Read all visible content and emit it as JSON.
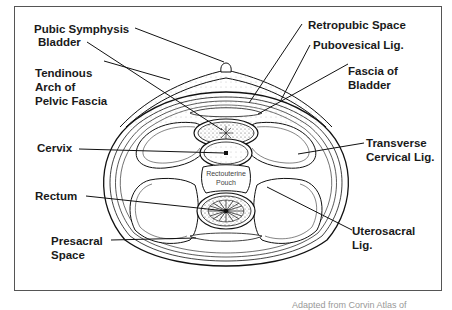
{
  "figure": {
    "labels": {
      "pubic_symphysis": "Pubic Symphysis",
      "bladder": "Bladder",
      "tendinous_arch": "Tendinous\nArch of\nPelvic Fascia",
      "cervix": "Cervix",
      "rectum": "Rectum",
      "presacral_space": "Presacral\nSpace",
      "retropubic_space": "Retropubic Space",
      "pubovesical_lig": "Pubovesical Lig.",
      "fascia_of_bladder": "Fascia of\nBladder",
      "transverse_cervical_lig": "Transverse\nCervical Lig.",
      "uterosacral_lig": "Uterosacral\nLig.",
      "rectouterine_pouch": "Rectouterine\nPouch"
    },
    "caption": "Adapted from Corvin Atlas of"
  }
}
